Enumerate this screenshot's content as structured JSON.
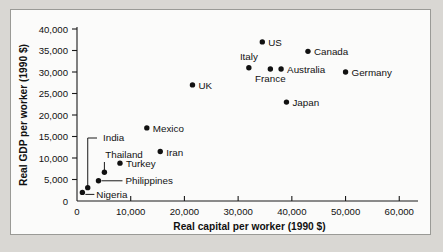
{
  "chart_data": {
    "type": "scatter",
    "title": "",
    "xlabel": "Real capital per worker (1990 $)",
    "ylabel": "Real GDP per worker (1990 $)",
    "xlim": [
      0,
      62000
    ],
    "ylim": [
      0,
      40000
    ],
    "grid": false,
    "legend": "none",
    "xticks": [
      0,
      10000,
      20000,
      30000,
      40000,
      50000,
      60000
    ],
    "xtick_labels": [
      "0",
      "10,000",
      "20,000",
      "30,000",
      "40,000",
      "50,000",
      "60,000"
    ],
    "yticks": [
      0,
      5000,
      10000,
      15000,
      20000,
      25000,
      30000,
      35000,
      40000
    ],
    "ytick_labels": [
      "0",
      "5,000",
      "10,000",
      "15,000",
      "20,000",
      "25,000",
      "30,000",
      "35,000",
      "40,000"
    ],
    "points": [
      {
        "label": "Nigeria",
        "x": 1000,
        "y": 2000,
        "label_dx": 10,
        "label_dy": 4,
        "label_anchor": "start",
        "leader": "horizontal-short"
      },
      {
        "label": "India",
        "x": 2000,
        "y": 3100,
        "label_dx": 0,
        "label_dy": 0,
        "label_anchor": "start",
        "leader": "elbow-up-left"
      },
      {
        "label": "Philippines",
        "x": 4000,
        "y": 4700,
        "label_dx": 22,
        "label_dy": 4,
        "label_anchor": "start",
        "leader": "horizontal"
      },
      {
        "label": "Thailand",
        "x": 5100,
        "y": 6700,
        "label_dx": 0,
        "label_dy": 0,
        "label_anchor": "middle",
        "leader": "vertical-up"
      },
      {
        "label": "Turkey",
        "x": 8000,
        "y": 8800,
        "label_dx": 6,
        "label_dy": 4,
        "label_anchor": "start",
        "leader": "none"
      },
      {
        "label": "Iran",
        "x": 15500,
        "y": 11500,
        "label_dx": 6,
        "label_dy": 4,
        "label_anchor": "start",
        "leader": "none"
      },
      {
        "label": "Mexico",
        "x": 13000,
        "y": 17000,
        "label_dx": 6,
        "label_dy": 4,
        "label_anchor": "start",
        "leader": "none"
      },
      {
        "label": "UK",
        "x": 21500,
        "y": 27000,
        "label_dx": 6,
        "label_dy": 4,
        "label_anchor": "start",
        "leader": "none"
      },
      {
        "label": "Japan",
        "x": 39000,
        "y": 23000,
        "label_dx": 6,
        "label_dy": 4,
        "label_anchor": "start",
        "leader": "none"
      },
      {
        "label": "Italy",
        "x": 32000,
        "y": 31000,
        "label_dx": 0,
        "label_dy": -8,
        "label_anchor": "middle",
        "leader": "none"
      },
      {
        "label": "France",
        "x": 36000,
        "y": 30700,
        "label_dx": 0,
        "label_dy": 13,
        "label_anchor": "middle",
        "leader": "none"
      },
      {
        "label": "Australia",
        "x": 38000,
        "y": 30700,
        "label_dx": 6,
        "label_dy": 4,
        "label_anchor": "start",
        "leader": "none"
      },
      {
        "label": "US",
        "x": 34500,
        "y": 37000,
        "label_dx": 6,
        "label_dy": 4,
        "label_anchor": "start",
        "leader": "none"
      },
      {
        "label": "Canada",
        "x": 43000,
        "y": 34800,
        "label_dx": 6,
        "label_dy": 4,
        "label_anchor": "start",
        "leader": "none"
      },
      {
        "label": "Germany",
        "x": 50000,
        "y": 30000,
        "label_dx": 6,
        "label_dy": 4,
        "label_anchor": "start",
        "leader": "none"
      }
    ]
  }
}
